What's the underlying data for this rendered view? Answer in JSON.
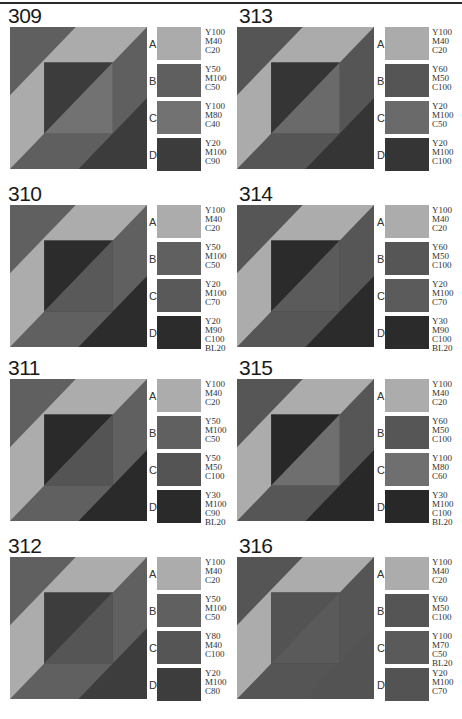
{
  "page": {
    "top_rule": true
  },
  "blocks": [
    {
      "number": "309",
      "colors": {
        "A": "#ababab",
        "B": "#5f5f5f",
        "C": "#727272",
        "D": "#3c3c3c"
      },
      "swatches": [
        {
          "label": "A",
          "cmyk": "Y100\nM40\nC20"
        },
        {
          "label": "B",
          "cmyk": "Y50\nM100\nC50"
        },
        {
          "label": "C",
          "cmyk": "Y100\nM80\nC40"
        },
        {
          "label": "D",
          "cmyk": "Y20\nM100\nC90"
        }
      ]
    },
    {
      "number": "313",
      "colors": {
        "A": "#ababab",
        "B": "#555555",
        "C": "#6a6a6a",
        "D": "#353535"
      },
      "swatches": [
        {
          "label": "A",
          "cmyk": "Y100\nM40\nC20"
        },
        {
          "label": "B",
          "cmyk": "Y60\nM50\nC100"
        },
        {
          "label": "C",
          "cmyk": "Y20\nM100\nC50"
        },
        {
          "label": "D",
          "cmyk": "Y20\nM100\nC100"
        }
      ]
    },
    {
      "number": "310",
      "colors": {
        "A": "#acacac",
        "B": "#606060",
        "C": "#595959",
        "D": "#2c2c2c"
      },
      "swatches": [
        {
          "label": "A",
          "cmyk": "Y100\nM40\nC20"
        },
        {
          "label": "B",
          "cmyk": "Y50\nM100\nC50"
        },
        {
          "label": "C",
          "cmyk": "Y20\nM100\nC70"
        },
        {
          "label": "D",
          "cmyk": "Y20\nM90\nC100\nBL20"
        }
      ]
    },
    {
      "number": "314",
      "colors": {
        "A": "#acacac",
        "B": "#565656",
        "C": "#5b5b5b",
        "D": "#2b2b2b"
      },
      "swatches": [
        {
          "label": "A",
          "cmyk": "Y100\nM40\nC20"
        },
        {
          "label": "B",
          "cmyk": "Y60\nM50\nC100"
        },
        {
          "label": "C",
          "cmyk": "Y20\nM100\nC70"
        },
        {
          "label": "D",
          "cmyk": "Y30\nM90\nC100\nBL20"
        }
      ]
    },
    {
      "number": "311",
      "colors": {
        "A": "#acacac",
        "B": "#606060",
        "C": "#545454",
        "D": "#2a2a2a"
      },
      "swatches": [
        {
          "label": "A",
          "cmyk": "Y100\nM40\nC20"
        },
        {
          "label": "B",
          "cmyk": "Y50\nM100\nC50"
        },
        {
          "label": "C",
          "cmyk": "Y50\nM50\nC100"
        },
        {
          "label": "D",
          "cmyk": "Y30\nM100\nC90\nBL20"
        }
      ]
    },
    {
      "number": "315",
      "colors": {
        "A": "#acacac",
        "B": "#565656",
        "C": "#6f6f6f",
        "D": "#282828"
      },
      "swatches": [
        {
          "label": "A",
          "cmyk": "Y100\nM40\nC20"
        },
        {
          "label": "B",
          "cmyk": "Y60\nM50\nC100"
        },
        {
          "label": "C",
          "cmyk": "Y100\nM80\nC60"
        },
        {
          "label": "D",
          "cmyk": "Y30\nM100\nC100\nBL20"
        }
      ]
    },
    {
      "number": "312",
      "colors": {
        "A": "#acacac",
        "B": "#606060",
        "C": "#555555",
        "D": "#3d3d3d"
      },
      "swatches": [
        {
          "label": "A",
          "cmyk": "Y100\nM40\nC20"
        },
        {
          "label": "B",
          "cmyk": "Y50\nM100\nC50"
        },
        {
          "label": "C",
          "cmyk": "Y80\nM40\nC100"
        },
        {
          "label": "D",
          "cmyk": "Y20\nM100\nC80"
        }
      ]
    },
    {
      "number": "316",
      "colors": {
        "A": "#acacac",
        "B": "#555555",
        "C": "#5a5a5a",
        "D": "#535353"
      },
      "swatches": [
        {
          "label": "A",
          "cmyk": "Y100\nM40\nC20"
        },
        {
          "label": "B",
          "cmyk": "Y60\nM50\nC100"
        },
        {
          "label": "C",
          "cmyk": "Y100\nM70\nC50\nBL20"
        },
        {
          "label": "D",
          "cmyk": "Y20\nM100\nC70"
        }
      ]
    }
  ]
}
